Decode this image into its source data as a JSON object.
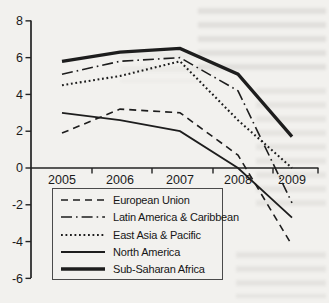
{
  "chart_data": {
    "type": "line",
    "title": "",
    "xlabel": "",
    "ylabel": "",
    "categories": [
      "2005",
      "2006",
      "2007",
      "2008",
      "2009"
    ],
    "series": [
      {
        "name": "European Union",
        "style": "dashed",
        "values": [
          1.9,
          3.2,
          3.0,
          0.7,
          -4.2
        ]
      },
      {
        "name": "Latin America & Caribbean",
        "style": "dashdot",
        "values": [
          5.1,
          5.8,
          6.0,
          4.2,
          -1.9
        ]
      },
      {
        "name": "East Asia & Pacific",
        "style": "dotted",
        "values": [
          4.5,
          5.0,
          5.8,
          2.6,
          0.0
        ]
      },
      {
        "name": "North America",
        "style": "solid",
        "values": [
          3.0,
          2.6,
          2.0,
          0.0,
          -2.7
        ]
      },
      {
        "name": "Sub-Saharan Africa",
        "style": "solid-thick",
        "values": [
          5.8,
          6.3,
          6.5,
          5.1,
          1.7
        ]
      }
    ],
    "ylim": [
      -6,
      8
    ],
    "yticks": [
      "8",
      "6",
      "4",
      "2",
      "0",
      "-2",
      "-4",
      "-6"
    ],
    "grid": false,
    "legend_position": "bottom-left",
    "x_axis_at_zero": true,
    "line_color": "#1d1d1d"
  }
}
